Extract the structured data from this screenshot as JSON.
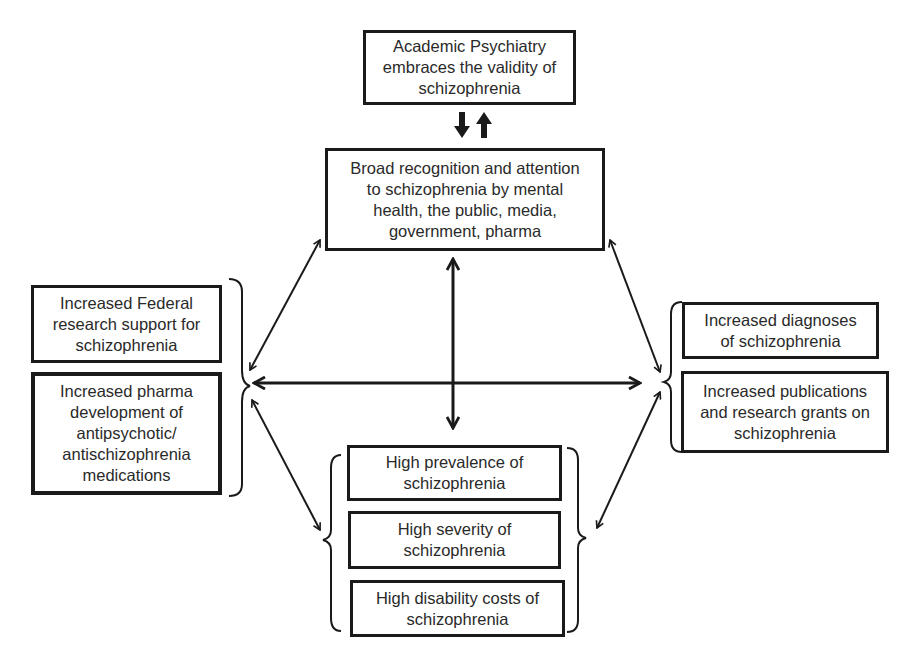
{
  "diagram": {
    "top": {
      "text": "Academic Psychiatry\nembraces the validity of\nschizophrenia"
    },
    "center": {
      "text": "Broad recognition and attention\nto schizophrenia by mental\nhealth, the public, media,\ngovernment, pharma"
    },
    "left_group": [
      {
        "text": "Increased Federal\nresearch support for\nschizophrenia"
      },
      {
        "text": "Increased pharma\ndevelopment of\nantipsychotic/\nantischizophrenia\nmedications"
      }
    ],
    "right_group": [
      {
        "text": "Increased diagnoses\nof schizophrenia"
      },
      {
        "text": "Increased publications\nand research grants on\nschizophrenia"
      }
    ],
    "bottom_group": [
      {
        "text": "High prevalence of\nschizophrenia"
      },
      {
        "text": "High severity of\nschizophrenia"
      },
      {
        "text": "High disability costs of\nschizophrenia"
      }
    ],
    "connections": [
      {
        "from": "top",
        "to": "center",
        "type": "bidirectional-block-arrows"
      },
      {
        "from": "center",
        "to": "left_group",
        "type": "double-headed"
      },
      {
        "from": "center",
        "to": "right_group",
        "type": "double-headed"
      },
      {
        "from": "center",
        "to": "bottom_group",
        "type": "double-headed"
      },
      {
        "from": "left_group",
        "to": "right_group",
        "type": "double-headed"
      },
      {
        "from": "left_group",
        "to": "bottom_group",
        "type": "double-headed"
      },
      {
        "from": "right_group",
        "to": "bottom_group",
        "type": "double-headed"
      }
    ],
    "colors": {
      "stroke": "#1a1a1a",
      "text": "#2a2a2a",
      "background": "#ffffff"
    }
  }
}
